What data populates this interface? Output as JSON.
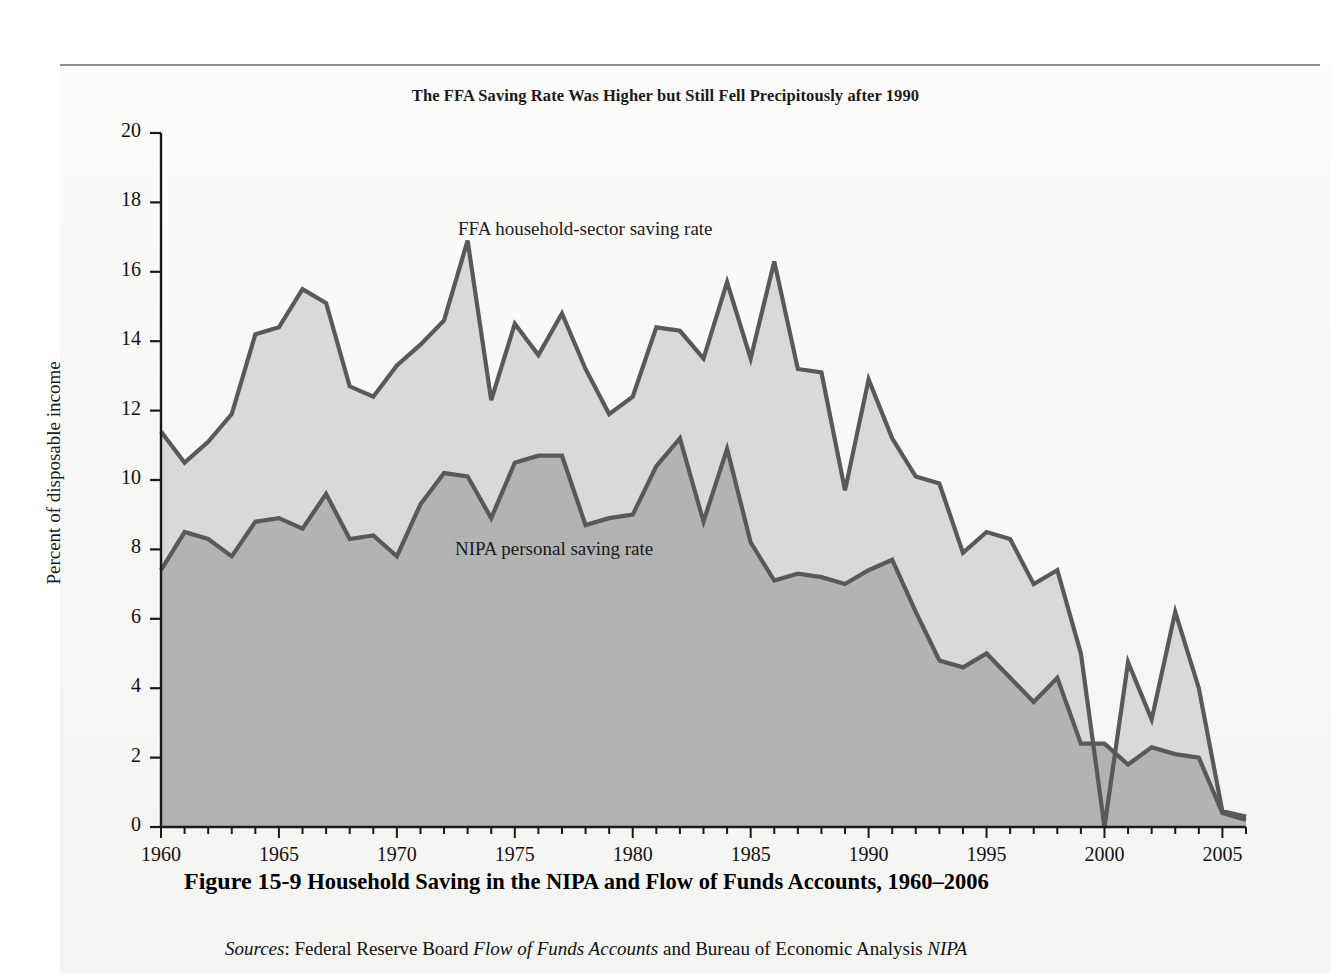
{
  "figure": {
    "chart_title": "The FFA Saving Rate Was Higher but Still Fell Precipitously after 1990",
    "caption_number": "Figure 15-9",
    "caption_text": "Household Saving in the NIPA and Flow of Funds Accounts, 1960–2006",
    "sources_label": "Sources",
    "sources_pre": ": Federal Reserve Board ",
    "sources_italic1": "Flow of Funds Accounts",
    "sources_mid": " and Bureau of Economic Analysis ",
    "sources_italic2": "NIPA"
  },
  "labels": {
    "ffa": "FFA household-sector saving rate",
    "nipa": "NIPA personal saving rate"
  },
  "colors": {
    "line": "#595959",
    "ffa_fill": "#d9d9d9",
    "nipa_fill": "#b3b3b3",
    "axis": "#1a1a1a",
    "page": "#f5f5f3"
  },
  "chart_data": {
    "type": "area",
    "title": "The FFA Saving Rate Was Higher but Still Fell Precipitously after 1990",
    "xlabel": "",
    "ylabel": "Percent of disposable income",
    "xlim": [
      1960,
      2006
    ],
    "ylim": [
      0,
      20
    ],
    "yticks": [
      0,
      2,
      4,
      6,
      8,
      10,
      12,
      14,
      16,
      18,
      20
    ],
    "xticks": [
      1960,
      1965,
      1970,
      1975,
      1980,
      1985,
      1990,
      1995,
      2000,
      2005
    ],
    "xtick_minor_step": 1,
    "grid": false,
    "legend": "inline-annotations",
    "x": [
      1960,
      1961,
      1962,
      1963,
      1964,
      1965,
      1966,
      1967,
      1968,
      1969,
      1970,
      1971,
      1972,
      1973,
      1974,
      1975,
      1976,
      1977,
      1978,
      1979,
      1980,
      1981,
      1982,
      1983,
      1984,
      1985,
      1986,
      1987,
      1988,
      1989,
      1990,
      1991,
      1992,
      1993,
      1994,
      1995,
      1996,
      1997,
      1998,
      1999,
      2000,
      2001,
      2002,
      2003,
      2004,
      2005,
      2006
    ],
    "series": [
      {
        "name": "FFA household-sector saving rate",
        "values": [
          11.4,
          10.5,
          11.1,
          11.9,
          14.2,
          14.4,
          15.5,
          15.1,
          12.7,
          12.4,
          13.3,
          13.9,
          14.6,
          16.9,
          12.3,
          14.5,
          13.6,
          14.8,
          13.2,
          11.9,
          12.4,
          14.4,
          14.3,
          13.5,
          15.7,
          13.5,
          16.3,
          13.2,
          13.1,
          9.7,
          12.9,
          11.2,
          10.1,
          9.9,
          7.9,
          8.5,
          8.3,
          7.0,
          7.4,
          5.0,
          0.0,
          4.75,
          3.1,
          6.2,
          4.0,
          0.45,
          0.3
        ]
      },
      {
        "name": "NIPA personal saving rate",
        "values": [
          7.4,
          8.5,
          8.3,
          7.8,
          8.8,
          8.9,
          8.6,
          9.6,
          8.3,
          8.4,
          7.8,
          9.3,
          10.2,
          10.1,
          8.9,
          10.5,
          10.7,
          10.7,
          8.7,
          8.9,
          9.0,
          10.4,
          11.2,
          8.8,
          10.9,
          8.2,
          7.1,
          7.3,
          7.2,
          7.0,
          7.4,
          7.7,
          6.2,
          4.8,
          4.6,
          5.0,
          4.3,
          3.6,
          4.3,
          2.4,
          2.4,
          1.8,
          2.3,
          2.1,
          2.0,
          0.4,
          0.2
        ]
      }
    ]
  }
}
